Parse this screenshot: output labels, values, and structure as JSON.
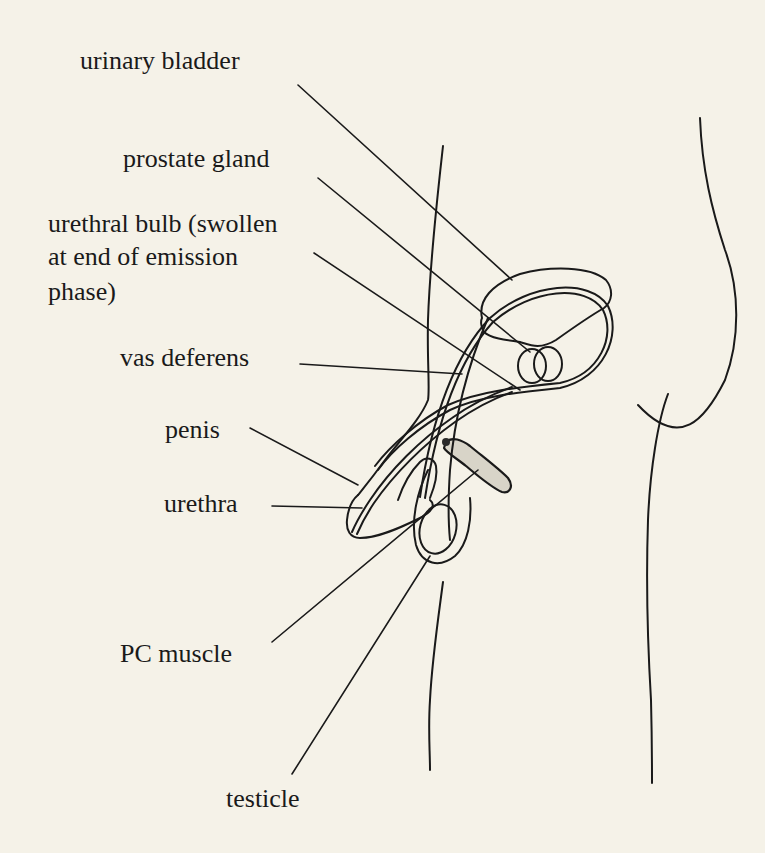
{
  "diagram": {
    "type": "anatomical-line-drawing",
    "background_color": "#f5f2e8",
    "line_color": "#1a1a1a",
    "labels": [
      {
        "id": "urinary-bladder",
        "text": "urinary bladder"
      },
      {
        "id": "prostate-gland",
        "text": "prostate gland"
      },
      {
        "id": "urethral-bulb",
        "lines": [
          "urethral bulb (swollen",
          "at end of emission",
          "phase)"
        ]
      },
      {
        "id": "vas-deferens",
        "text": "vas deferens"
      },
      {
        "id": "penis",
        "text": "penis"
      },
      {
        "id": "urethra",
        "text": "urethra"
      },
      {
        "id": "pc-muscle",
        "text": "PC muscle"
      },
      {
        "id": "testicle",
        "text": "testicle"
      }
    ]
  }
}
